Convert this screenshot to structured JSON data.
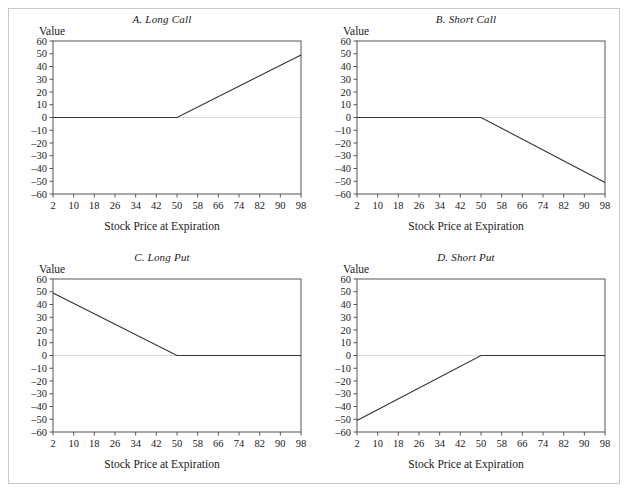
{
  "figure": {
    "panel_count": 4,
    "value_axis_label": "Value",
    "x_axis_label": "Stock Price at Expiration",
    "frame_color": "#555555",
    "line_color": "#333333",
    "zero_line_color": "#d8d8d8",
    "border_color": "#c9c9c9"
  },
  "chart_data": [
    {
      "type": "line",
      "title": "A. Long Call",
      "xlabel": "Stock Price at Expiration",
      "ylabel": "Value",
      "xlim": [
        2,
        98
      ],
      "ylim": [
        -60,
        60
      ],
      "xticks": [
        2,
        10,
        18,
        26,
        34,
        42,
        50,
        58,
        66,
        74,
        82,
        90,
        98
      ],
      "yticks": [
        60,
        50,
        40,
        30,
        20,
        10,
        0,
        -10,
        -20,
        -30,
        -40,
        -50,
        -60
      ],
      "ytick_labels": [
        "60",
        "50",
        "40",
        "30",
        "20",
        "10",
        "0",
        "–10",
        "–20",
        "–30",
        "–40",
        "–50",
        "–60"
      ],
      "grid": false,
      "zero_line": true,
      "legend": "none",
      "strike": 50,
      "series": [
        {
          "name": "Long Call payoff",
          "x": [
            2,
            50,
            98
          ],
          "values": [
            0,
            0,
            49
          ]
        }
      ]
    },
    {
      "type": "line",
      "title": "B. Short Call",
      "xlabel": "Stock Price at Expiration",
      "ylabel": "Value",
      "xlim": [
        2,
        98
      ],
      "ylim": [
        -60,
        60
      ],
      "xticks": [
        2,
        10,
        18,
        26,
        34,
        42,
        50,
        58,
        66,
        74,
        82,
        90,
        98
      ],
      "yticks": [
        60,
        50,
        40,
        30,
        20,
        10,
        0,
        -10,
        -20,
        -30,
        -40,
        -50,
        -60
      ],
      "ytick_labels": [
        "60",
        "50",
        "40",
        "30",
        "20",
        "10",
        "0",
        "–10",
        "–20",
        "–30",
        "–40",
        "–50",
        "–60"
      ],
      "grid": false,
      "zero_line": true,
      "legend": "none",
      "strike": 50,
      "series": [
        {
          "name": "Short Call payoff",
          "x": [
            2,
            50,
            98
          ],
          "values": [
            0,
            0,
            -51
          ]
        }
      ]
    },
    {
      "type": "line",
      "title": "C. Long Put",
      "xlabel": "Stock Price at Expiration",
      "ylabel": "Value",
      "xlim": [
        2,
        98
      ],
      "ylim": [
        -60,
        60
      ],
      "xticks": [
        2,
        10,
        18,
        26,
        34,
        42,
        50,
        58,
        66,
        74,
        82,
        90,
        98
      ],
      "yticks": [
        60,
        50,
        40,
        30,
        20,
        10,
        0,
        -10,
        -20,
        -30,
        -40,
        -50,
        -60
      ],
      "ytick_labels": [
        "60",
        "50",
        "40",
        "30",
        "20",
        "10",
        "0",
        "–10",
        "–20",
        "–30",
        "–40",
        "–50",
        "–60"
      ],
      "grid": false,
      "zero_line": true,
      "legend": "none",
      "strike": 50,
      "series": [
        {
          "name": "Long Put payoff",
          "x": [
            2,
            50,
            98
          ],
          "values": [
            49,
            0,
            0
          ]
        }
      ]
    },
    {
      "type": "line",
      "title": "D. Short Put",
      "xlabel": "Stock Price at Expiration",
      "ylabel": "Value",
      "xlim": [
        2,
        98
      ],
      "ylim": [
        -60,
        60
      ],
      "xticks": [
        2,
        10,
        18,
        26,
        34,
        42,
        50,
        58,
        66,
        74,
        82,
        90,
        98
      ],
      "yticks": [
        60,
        50,
        40,
        30,
        20,
        10,
        0,
        -10,
        -20,
        -30,
        -40,
        -50,
        -60
      ],
      "ytick_labels": [
        "60",
        "50",
        "40",
        "30",
        "20",
        "10",
        "0",
        "–10",
        "–20",
        "–30",
        "–40",
        "–50",
        "–60"
      ],
      "grid": false,
      "zero_line": true,
      "legend": "none",
      "strike": 50,
      "series": [
        {
          "name": "Short Put payoff",
          "x": [
            2,
            50,
            98
          ],
          "values": [
            -51,
            0,
            0
          ]
        }
      ]
    }
  ]
}
